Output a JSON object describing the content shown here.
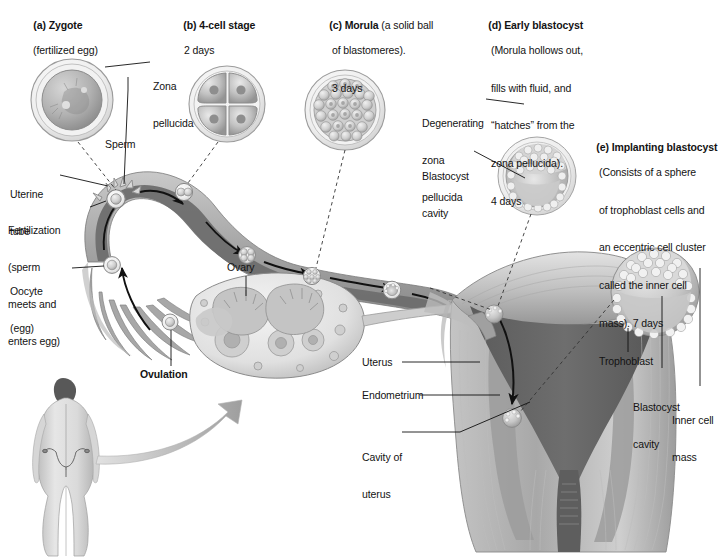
{
  "figure": {
    "type": "biological-process-diagram",
    "palette": {
      "ink": "#131313",
      "tube_lumen": "#6f6f6f",
      "tube_wall_light": "#b9b9b9",
      "tube_wall_mid": "#9a9a9a",
      "uterus_wall": "#a9a9a9",
      "uterus_cavity": "#5f5f5f",
      "endometrium": "#8e8e8e",
      "cell_light": "#d8d8d8",
      "cell_mid": "#ababab",
      "zona": "#e8e8e8",
      "body_skin": "#cfcfcf",
      "hair": "#4a4a4a",
      "background": "#ffffff"
    }
  },
  "stages": [
    {
      "key": "a",
      "marker": "(a)",
      "name": "Zygote",
      "detail": "(fertilized egg)",
      "day": "",
      "lines": [
        "(fertilized egg)"
      ]
    },
    {
      "key": "b",
      "marker": "(b)",
      "name": "4-cell stage",
      "detail": "",
      "day": "2 days",
      "lines": [
        "2 days"
      ]
    },
    {
      "key": "c",
      "marker": "(c)",
      "name": "Morula",
      "detail": "(a solid ball of blastomeres).",
      "day": "3 days",
      "lines": [
        "(a solid ball",
        "of blastomeres).",
        "3 days"
      ]
    },
    {
      "key": "d",
      "marker": "(d)",
      "name": "Early blastocyst",
      "detail": "(Morula hollows out, fills with fluid, and “hatches” from the zona pellucida).",
      "day": "4 days",
      "lines": [
        "(Morula hollows out,",
        "fills with fluid, and",
        "“hatches” from the",
        "zona pellucida).",
        "4 days"
      ]
    },
    {
      "key": "e",
      "marker": "(e)",
      "name": "Implanting blastocyst",
      "detail": "(Consists of a sphere of trophoblast cells and an eccentric cell cluster called the inner cell mass).",
      "day": "7 days",
      "lines": [
        "(Consists of a sphere",
        "of trophoblast cells and",
        "an eccentric cell cluster",
        "called the inner cell",
        "mass). 7 days"
      ]
    }
  ],
  "callouts": {
    "zona_pellucida": "Zona\npellucida",
    "zona_pellucida_l1": "Zona",
    "zona_pellucida_l2": "pellucida",
    "sperm": "Sperm",
    "uterine_tube_l1": "Uterine",
    "uterine_tube_l2": "tube",
    "fertilization": "Fertilization",
    "fertilization_l1": "(sperm",
    "fertilization_l2": "meets and",
    "fertilization_l3": "enters egg)",
    "oocyte": "Oocyte",
    "oocyte_sub": "(egg)",
    "ovulation": "Ovulation",
    "ovary": "Ovary",
    "degenerating_l1": "Degenerating",
    "degenerating_l2": "zona",
    "degenerating_l3": "pellucida",
    "blastocyst_cavity_d_l1": "Blastocyst",
    "blastocyst_cavity_d_l2": "cavity",
    "uterus": "Uterus",
    "endometrium": "Endometrium",
    "cavity_of_uterus_l1": "Cavity of",
    "cavity_of_uterus_l2": "uterus",
    "trophoblast": "Trophoblast",
    "blastocyst_cavity_e_l1": "Blastocyst",
    "blastocyst_cavity_e_l2": "cavity",
    "inner_cell_mass_l1": "Inner cell",
    "inner_cell_mass_l2": "mass"
  },
  "anatomy": {
    "female_figure": "posterior view of female body with uterus and uterine tubes overlaid",
    "ovary_label": "Ovary",
    "flow_direction": "ovary → fimbriae → ampulla (fertilization) → uterine tube → uterine cavity → endometrium (implantation)"
  }
}
